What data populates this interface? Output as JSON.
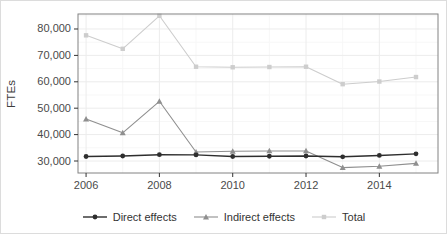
{
  "window": {
    "width": 447,
    "height": 234,
    "background": "#ffffff",
    "frame_border_color": "#dcdcdc"
  },
  "chart_data": {
    "type": "line",
    "title": "",
    "xlabel": "",
    "ylabel": "FTEs",
    "x": [
      2006,
      2007,
      2008,
      2009,
      2010,
      2011,
      2012,
      2013,
      2014,
      2015
    ],
    "series": [
      {
        "name": "Direct effects",
        "marker": "circle",
        "color": "#2e2e2e",
        "line_width": 1.4,
        "values": [
          31700,
          31900,
          32400,
          32300,
          31700,
          31800,
          31900,
          31600,
          32100,
          32700
        ]
      },
      {
        "name": "Indirect effects",
        "marker": "triangle",
        "color": "#8f8f8f",
        "line_width": 1.1,
        "values": [
          45900,
          40700,
          52600,
          33400,
          33700,
          33800,
          33800,
          27500,
          28000,
          29100
        ]
      },
      {
        "name": "Total",
        "marker": "square",
        "color": "#cdcdcd",
        "line_width": 1.1,
        "values": [
          77600,
          72500,
          85000,
          65700,
          65500,
          65600,
          65700,
          59100,
          60100,
          61800
        ]
      }
    ],
    "x_ticks": {
      "values": [
        2006,
        2008,
        2010,
        2012,
        2014
      ],
      "labels": [
        "2006",
        "2008",
        "2010",
        "2012",
        "2014"
      ]
    },
    "x_minor": [
      2007,
      2009,
      2011,
      2013,
      2015
    ],
    "y_ticks": {
      "values": [
        30000,
        40000,
        50000,
        60000,
        70000,
        80000
      ],
      "labels": [
        "30,000",
        "40,000",
        "50,000",
        "60,000",
        "70,000",
        "80,000"
      ]
    },
    "y_minor": [
      35000,
      45000,
      55000,
      65000,
      75000,
      85000
    ],
    "xlim": [
      2005.78,
      2015.6
    ],
    "ylim": [
      25455,
      85680
    ],
    "grid": {
      "on": true,
      "major_color": "#ececec",
      "minor_color": "#f7f7f7"
    },
    "panel": {
      "left": 77,
      "top": 13,
      "right": 437,
      "bottom": 172,
      "border_color": "#828282",
      "background": "#ffffff"
    },
    "axis_text_color": "#4a4a4a",
    "tick_color": "#333333",
    "legend_position": "bottom"
  }
}
